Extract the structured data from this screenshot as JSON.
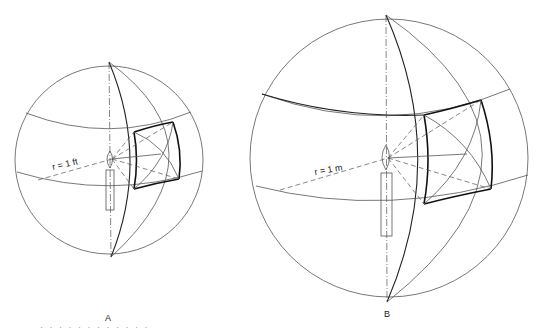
{
  "figure": {
    "panel_a": {
      "label": "A",
      "radius_label": "r = 1 ft"
    },
    "panel_b": {
      "label": "B",
      "radius_label": "r = 1 m"
    },
    "caption_fragment": "· · · · ·   · · · ·     ·         · ·"
  }
}
